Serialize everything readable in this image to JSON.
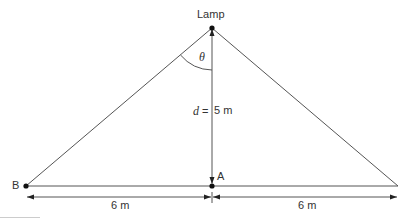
{
  "diagram": {
    "labels": {
      "lamp": "Lamp",
      "angle": "θ",
      "distance_var": "d",
      "distance_eq": "=",
      "distance_value": "5 m",
      "point_a": "A",
      "point_b": "B",
      "left_span": "6 m",
      "right_span": "6 m"
    },
    "geometry": {
      "lamp": [
        212,
        28
      ],
      "point_a": [
        212,
        186
      ],
      "point_b": [
        26,
        186
      ],
      "right_vertex": [
        398,
        186
      ],
      "height_m": 5,
      "half_base_m": 6
    },
    "colors": {
      "line": "#555555",
      "dot": "#111111",
      "text": "#333333",
      "footer_rule": "#cccccc"
    }
  }
}
